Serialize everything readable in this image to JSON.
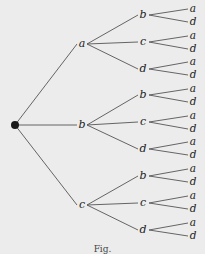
{
  "diagram": {
    "type": "tree",
    "caption": "Fig.",
    "root": {
      "x": 15,
      "y": 125
    },
    "level1": [
      {
        "label": "a",
        "x": 82,
        "y": 44,
        "children": [
          {
            "label": "b",
            "x": 143,
            "y": 15,
            "leaves": [
              {
                "label": "a",
                "x": 193,
                "y": 9
              },
              {
                "label": "d",
                "x": 193,
                "y": 22
              }
            ]
          },
          {
            "label": "c",
            "x": 143,
            "y": 42,
            "leaves": [
              {
                "label": "a",
                "x": 193,
                "y": 36
              },
              {
                "label": "d",
                "x": 193,
                "y": 49
              }
            ]
          },
          {
            "label": "d",
            "x": 143,
            "y": 69,
            "leaves": [
              {
                "label": "a",
                "x": 193,
                "y": 62
              },
              {
                "label": "d",
                "x": 193,
                "y": 75
              }
            ]
          }
        ]
      },
      {
        "label": "b",
        "x": 82,
        "y": 125,
        "children": [
          {
            "label": "b",
            "x": 143,
            "y": 95,
            "leaves": [
              {
                "label": "a",
                "x": 193,
                "y": 89
              },
              {
                "label": "d",
                "x": 193,
                "y": 102
              }
            ]
          },
          {
            "label": "c",
            "x": 143,
            "y": 122,
            "leaves": [
              {
                "label": "a",
                "x": 193,
                "y": 116
              },
              {
                "label": "d",
                "x": 193,
                "y": 129
              }
            ]
          },
          {
            "label": "d",
            "x": 143,
            "y": 149,
            "leaves": [
              {
                "label": "a",
                "x": 193,
                "y": 142
              },
              {
                "label": "d",
                "x": 193,
                "y": 155
              }
            ]
          }
        ]
      },
      {
        "label": "c",
        "x": 82,
        "y": 205,
        "children": [
          {
            "label": "b",
            "x": 143,
            "y": 176,
            "leaves": [
              {
                "label": "a",
                "x": 193,
                "y": 169
              },
              {
                "label": "d",
                "x": 193,
                "y": 182
              }
            ]
          },
          {
            "label": "c",
            "x": 143,
            "y": 203,
            "leaves": [
              {
                "label": "a",
                "x": 193,
                "y": 196
              },
              {
                "label": "d",
                "x": 193,
                "y": 209
              }
            ]
          },
          {
            "label": "d",
            "x": 143,
            "y": 230,
            "leaves": [
              {
                "label": "a",
                "x": 193,
                "y": 223
              },
              {
                "label": "d",
                "x": 193,
                "y": 236
              }
            ]
          }
        ]
      }
    ]
  },
  "colors": {
    "line": "#555555",
    "root": "#1a1a1a",
    "background": "#ececec",
    "text": "#222222"
  }
}
